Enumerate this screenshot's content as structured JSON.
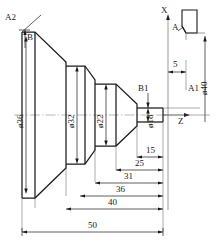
{
  "drawing": {
    "title": "Turned shaft part profile with dimensions",
    "axes": {
      "x_label": "X",
      "z_label": "Z"
    },
    "tool": {
      "name": "cutting-tool",
      "label": "A"
    },
    "points": [
      {
        "id": "A2",
        "label": "A2"
      },
      {
        "id": "B",
        "label": "B"
      },
      {
        "id": "B1",
        "label": "B1"
      },
      {
        "id": "A1",
        "label": "A1"
      }
    ],
    "diameters": [
      {
        "id": "d36",
        "label": "ø36",
        "value": 36
      },
      {
        "id": "d32",
        "label": "ø32",
        "value": 32
      },
      {
        "id": "d22",
        "label": "ø22",
        "value": 22
      },
      {
        "id": "d18",
        "label": "ø18",
        "value": 18
      },
      {
        "id": "d40",
        "label": "ø40",
        "value": 40
      }
    ],
    "lengths": [
      {
        "id": "L5",
        "label": "5",
        "value": 5
      },
      {
        "id": "L15",
        "label": "15",
        "value": 15
      },
      {
        "id": "L25",
        "label": "25",
        "value": 25
      },
      {
        "id": "L31",
        "label": "31",
        "value": 31
      },
      {
        "id": "L36",
        "label": "36",
        "value": 36
      },
      {
        "id": "L40",
        "label": "40",
        "value": 40
      },
      {
        "id": "L50",
        "label": "50",
        "value": 50
      }
    ],
    "colors": {
      "line": "#1a1a1a",
      "thin": "#555555",
      "center": "#8a8a8a",
      "background": "#ffffff"
    },
    "caption": ""
  }
}
